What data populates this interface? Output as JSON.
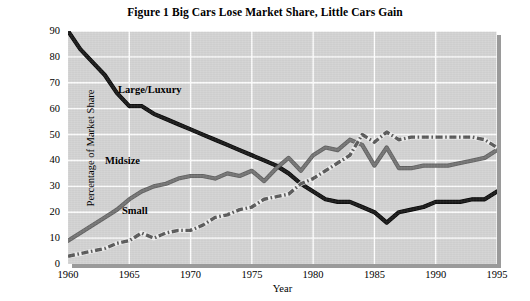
{
  "chart_data": {
    "type": "line",
    "title": "Figure 1  Big Cars Lose Market Share, Little Cars Gain",
    "xlabel": "Year",
    "ylabel": "Percentage of Market Share",
    "xlim": [
      1960,
      1995
    ],
    "ylim": [
      0,
      90
    ],
    "grid": true,
    "legend_position": "inline-annotations",
    "xticks": [
      "1960",
      "1965",
      "1970",
      "1975",
      "1980",
      "1985",
      "1990",
      "1995"
    ],
    "yticks": [
      "0",
      "10",
      "20",
      "30",
      "40",
      "50",
      "60",
      "70",
      "80",
      "90"
    ],
    "x": [
      1960,
      1961,
      1962,
      1963,
      1964,
      1965,
      1966,
      1967,
      1968,
      1969,
      1970,
      1971,
      1972,
      1973,
      1974,
      1975,
      1976,
      1977,
      1978,
      1979,
      1980,
      1981,
      1982,
      1983,
      1984,
      1985,
      1986,
      1987,
      1988,
      1989,
      1990,
      1991,
      1992,
      1993,
      1994,
      1995
    ],
    "series": [
      {
        "name": "Large/Luxury",
        "color": "#1a1a1a",
        "style": "solid",
        "values": [
          90,
          83,
          78,
          73,
          66,
          61,
          61,
          58,
          56,
          54,
          52,
          50,
          48,
          46,
          44,
          42,
          40,
          38,
          35,
          31,
          28,
          25,
          24,
          24,
          22,
          20,
          16,
          20,
          21,
          22,
          24,
          24,
          24,
          25,
          25,
          28
        ]
      },
      {
        "name": "Midsize",
        "color": "#757575",
        "style": "solid",
        "values": [
          9,
          12,
          15,
          18,
          21,
          25,
          28,
          30,
          31,
          33,
          34,
          34,
          33,
          35,
          34,
          36,
          32,
          37,
          41,
          36,
          42,
          45,
          44,
          48,
          46,
          38,
          45,
          37,
          37,
          38,
          38,
          38,
          39,
          40,
          41,
          44
        ]
      },
      {
        "name": "Small",
        "color": "#5a5a5a",
        "style": "dash-dot",
        "values": [
          3,
          4,
          5,
          6,
          8,
          9,
          12,
          10,
          12,
          13,
          13,
          15,
          18,
          19,
          21,
          22,
          25,
          26,
          27,
          31,
          33,
          36,
          39,
          42,
          50,
          47,
          51,
          48,
          49,
          49,
          49,
          49,
          49,
          49,
          48,
          45
        ]
      }
    ],
    "annotations": [
      {
        "text": "Large/Luxury",
        "x_px": 118,
        "y_px": 91
      },
      {
        "text": "Midsize",
        "x_px": 105,
        "y_px": 162
      },
      {
        "text": "Small",
        "x_px": 122,
        "y_px": 212
      }
    ]
  }
}
